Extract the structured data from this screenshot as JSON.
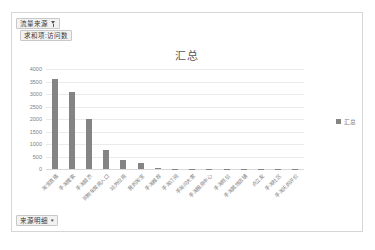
{
  "chart_frame": {
    "name": "pivot-chart"
  },
  "fields": {
    "source_filter": {
      "label": "流量来源",
      "icon": "funnel-icon"
    },
    "measure": {
      "label": "求和项:访问数"
    },
    "detail": {
      "label": "来源明细",
      "icon": "chevron-down-icon"
    }
  },
  "legend": {
    "label": "汇总",
    "color": "#848484",
    "position": "right"
  },
  "chart_data": {
    "type": "bar",
    "title": "汇总",
    "xlabel": "",
    "ylabel": "",
    "ylim": [
      0,
      4000
    ],
    "ytick_labels": [
      "4000",
      "3500",
      "3000",
      "2500",
      "2000",
      "1500",
      "1000",
      "500",
      "0"
    ],
    "yticks": [
      4000,
      3500,
      3000,
      2500,
      2000,
      1500,
      1000,
      500,
      0
    ],
    "grid": true,
    "legend": [
      "汇总"
    ],
    "bar_color": "#848484",
    "categories": [
      "淘宝直播",
      "手淘搜索",
      "手淘首页",
      "购物车常用入口",
      "站外应用",
      "我的淘宝",
      "手淘推荐",
      "手淘订阅",
      "手淘问大家",
      "手淘服务中心",
      "手淘旺信",
      "手淘其他店铺",
      "点立友",
      "手淘社区",
      "手淘天的评价"
    ],
    "series": [
      {
        "name": "汇总",
        "values": [
          3600,
          3100,
          2000,
          780,
          350,
          230,
          40,
          20,
          15,
          12,
          10,
          8,
          6,
          5,
          4
        ]
      }
    ]
  }
}
